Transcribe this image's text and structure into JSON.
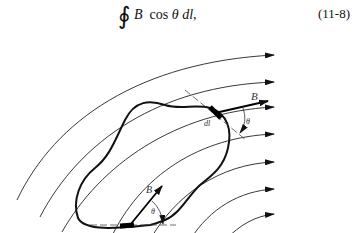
{
  "equation": {
    "integral_symbol": "∮",
    "B": "B",
    "cos": "cos",
    "theta": "θ",
    "dl": "dl,",
    "number": "(11-8)"
  },
  "figure": {
    "labels": {
      "B_top": "B",
      "dl_top": "dl",
      "theta_top": "θ",
      "B_bottom": "B",
      "theta_bottom": "θ"
    },
    "field_line_count": 7
  }
}
